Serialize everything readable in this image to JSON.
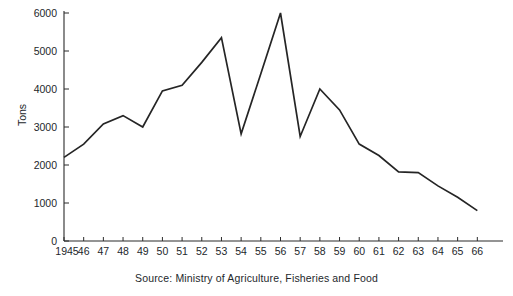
{
  "chart_data": {
    "type": "line",
    "title": "",
    "subtitle": "",
    "xlabel": "",
    "ylabel": "Tons",
    "xlim": [
      1945,
      1967
    ],
    "ylim": [
      0,
      6000
    ],
    "grid": false,
    "legend": null,
    "x": [
      1945,
      1946,
      1947,
      1948,
      1949,
      1950,
      1951,
      1952,
      1953,
      1954,
      1955,
      1956,
      1957,
      1958,
      1959,
      1960,
      1961,
      1962,
      1963,
      1964,
      1965,
      1966
    ],
    "values": [
      2200,
      2550,
      3080,
      3300,
      3000,
      3950,
      4100,
      4700,
      5350,
      2820,
      4400,
      6000,
      2750,
      4000,
      3450,
      2550,
      2250,
      1820,
      1800,
      1450,
      1150,
      800
    ],
    "series": [
      {
        "name": "Tons",
        "values": [
          2200,
          2550,
          3080,
          3300,
          3000,
          3950,
          4100,
          4700,
          5350,
          2820,
          4400,
          6000,
          2750,
          4000,
          3450,
          2550,
          2250,
          1820,
          1800,
          1450,
          1150,
          800
        ]
      }
    ],
    "xtick_labels": [
      "1945",
      "46",
      "47",
      "48",
      "49",
      "50",
      "51",
      "52",
      "53",
      "54",
      "55",
      "56",
      "57",
      "58",
      "59",
      "60",
      "61",
      "62",
      "63",
      "64",
      "65",
      "66"
    ],
    "ytick_labels": [
      "0",
      "1000",
      "2000",
      "3000",
      "4000",
      "5000",
      "6000"
    ],
    "ytick_values": [
      0,
      1000,
      2000,
      3000,
      4000,
      5000,
      6000
    ],
    "line_color": "#252525",
    "axis_color": "#2b2b2b",
    "background_color": "#ffffff"
  },
  "notes": {
    "source": "Source: Ministry of Agriculture, Fisheries and Food"
  }
}
